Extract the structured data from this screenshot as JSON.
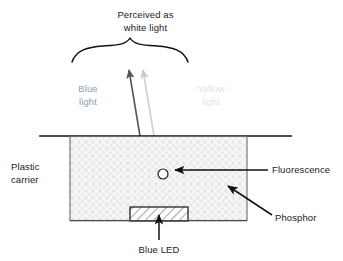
{
  "diagram": {
    "labels": {
      "perceived": "Perceived as\nwhite light",
      "blue_light": "Blue\nlight",
      "yellow_light": "Yellow\nlight",
      "plastic_carrier": "Plastic\ncarrier",
      "fluorescence": "Fluorescence",
      "phosphor": "Phosphor",
      "blue_led": "Blue LED"
    },
    "colors": {
      "outline": "#000000",
      "blue_ray": "#555555",
      "yellow_ray": "#cccccc",
      "blue_light_text": "#8d9aa8",
      "yellow_light_text": "#e2e2e2",
      "phosphor_fill": "#f4f4f4",
      "phosphor_dots": "#e8e8e8",
      "led_fill": "#ffffff",
      "text": "#1a1a1a",
      "background": "#ffffff"
    },
    "parts": [
      {
        "name": "brace",
        "description": "downward curly brace spanning emitted light cone"
      },
      {
        "name": "blue-ray-arrow",
        "description": "dark gray arrow from LED through phosphor upward"
      },
      {
        "name": "yellow-ray-arrow",
        "description": "light gray arrow from fluorescence point upward"
      },
      {
        "name": "phosphor-box",
        "description": "stippled rectangle containing phosphor"
      },
      {
        "name": "fluorescence-point",
        "description": "small white circle inside phosphor"
      },
      {
        "name": "blue-led-block",
        "description": "hatched rectangle at bottom center"
      },
      {
        "name": "carrier-line",
        "description": "horizontal top rim line of plastic carrier"
      }
    ]
  }
}
